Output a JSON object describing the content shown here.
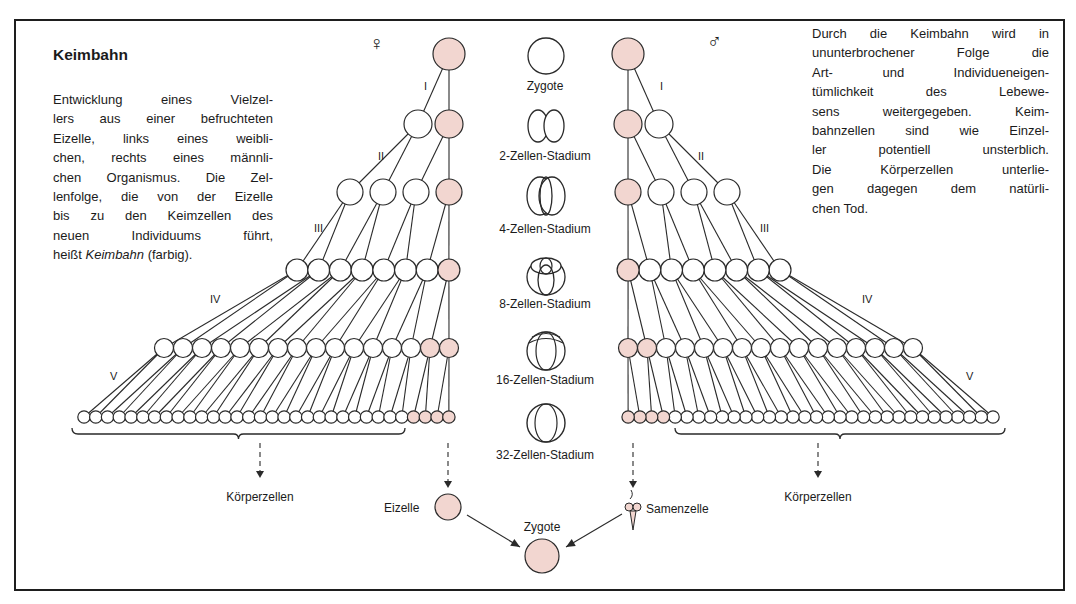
{
  "title": "Keimbahn",
  "left_paragraph": {
    "lines": [
      "Entwicklung eines Vielzel-",
      "lers aus einer befruchteten",
      "Eizelle, links eines weibli-",
      "chen, rechts eines männli-",
      "chen Organismus. Die Zel-",
      "lenfolge, die von der Eizelle",
      "bis zu den Keimzellen des",
      "neuen Individuums führt,"
    ],
    "last_line_prefix": "heißt ",
    "last_line_italic": "Keimbahn",
    "last_line_suffix": " (farbig)."
  },
  "right_paragraph": {
    "lines": [
      "Durch die Keimbahn wird in",
      "ununterbrochener Folge die",
      "Art- und Individueneigen-",
      "tümlichkeit des Lebewe-",
      "sens weitergegeben. Keim-",
      "bahnzellen sind wie Einzel-",
      "ler potentiell unsterblich.",
      "Die Körperzellen unterlie-",
      "gen dagegen dem natürli-",
      "chen Tod."
    ]
  },
  "symbols": {
    "female": "♀",
    "male": "♂"
  },
  "division_labels": [
    "I",
    "II",
    "III",
    "IV",
    "V"
  ],
  "stages": [
    {
      "label": "Zygote",
      "cells": 1
    },
    {
      "label": "2-Zellen-Stadium",
      "cells": 2
    },
    {
      "label": "4-Zellen-Stadium",
      "cells": 4
    },
    {
      "label": "8-Zellen-Stadium",
      "cells": 8
    },
    {
      "label": "16-Zellen-Stadium",
      "cells": 16
    },
    {
      "label": "32-Zellen-Stadium",
      "cells": 32
    }
  ],
  "bottom": {
    "left_somatic_label": "Körperzellen",
    "right_somatic_label": "Körperzellen",
    "egg_label": "Eizelle",
    "sperm_label": "Samenzelle",
    "zygote_label": "Zygote"
  },
  "colors": {
    "germline_fill": "#f2d6d0",
    "somatic_fill": "#ffffff",
    "stroke": "#2a2a2a"
  }
}
